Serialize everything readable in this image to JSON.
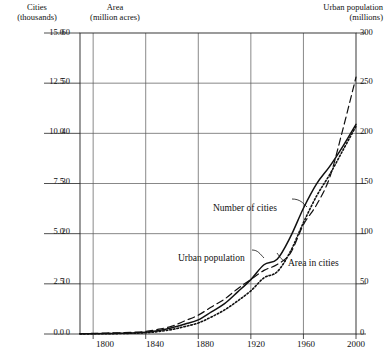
{
  "chart_data": {
    "type": "line",
    "title": "",
    "subtitle": "",
    "xlabel": "",
    "xlim": [
      1790,
      2000
    ],
    "xticks": [
      1800,
      1840,
      1880,
      1920,
      1960,
      2000
    ],
    "grid": true,
    "legend_position": "inline-annotations",
    "axes": [
      {
        "id": "left-outer",
        "name": "Cities",
        "unit_label": "(thousands)",
        "header_line1": "Cities",
        "header_line2": "(thousands)",
        "ticks": [
          "0.0",
          "2.5",
          "5.0",
          "7.5",
          "10.0",
          "12.5",
          "15.0"
        ],
        "ylim": [
          0,
          15
        ]
      },
      {
        "id": "left-inner",
        "name": "Area",
        "unit_label": "(million acres)",
        "header_line1": "Area",
        "header_line2": "(million acres)",
        "ticks": [
          "0",
          "10",
          "20",
          "30",
          "40",
          "50",
          "60"
        ],
        "ylim": [
          0,
          60
        ]
      },
      {
        "id": "right",
        "name": "Urban population",
        "unit_label": "(millions)",
        "header_line1": "Urban population",
        "header_line2": "(millions)",
        "ticks": [
          "0",
          "50",
          "100",
          "150",
          "200",
          "250",
          "300"
        ],
        "ylim": [
          0,
          300
        ]
      }
    ],
    "x": [
      1790,
      1800,
      1810,
      1820,
      1830,
      1840,
      1850,
      1860,
      1870,
      1880,
      1890,
      1900,
      1910,
      1920,
      1930,
      1940,
      1950,
      1960,
      1970,
      1980,
      1990,
      2000
    ],
    "series": [
      {
        "name": "Number of cities",
        "label": "Number of cities",
        "axis": "left-outer",
        "units": "thousands",
        "style": "dashed",
        "values": [
          0.02,
          0.03,
          0.05,
          0.06,
          0.09,
          0.13,
          0.24,
          0.39,
          0.66,
          0.94,
          1.35,
          1.74,
          2.26,
          2.72,
          3.17,
          3.46,
          4.02,
          5.45,
          6.44,
          7.8,
          10.2,
          12.8
        ]
      },
      {
        "name": "Urban population",
        "label": "Urban population",
        "axis": "right",
        "units": "millions",
        "style": "solid",
        "values": [
          0.2,
          0.3,
          0.5,
          0.7,
          1.1,
          1.8,
          3.5,
          6.2,
          9.9,
          14.1,
          22.1,
          30.2,
          42.0,
          54.2,
          69.0,
          74.4,
          96.5,
          125.3,
          149.6,
          167.1,
          187.1,
          209.0
        ]
      },
      {
        "name": "Area in cities",
        "label": "Area in cities",
        "axis": "left-inner",
        "units": "million acres",
        "style": "dotted",
        "values": [
          0.02,
          0.04,
          0.06,
          0.09,
          0.15,
          0.25,
          0.5,
          0.9,
          1.5,
          2.2,
          3.4,
          4.8,
          6.6,
          8.6,
          11.2,
          12.4,
          16.4,
          22.2,
          27.5,
          31.8,
          36.6,
          41.4
        ]
      }
    ],
    "annotations": [
      {
        "text": "Number of cities",
        "for": "Number of cities"
      },
      {
        "text": "Urban population",
        "for": "Urban population"
      },
      {
        "text": "Area in cities",
        "for": "Area in cities"
      }
    ]
  },
  "headers": {
    "cities_l1": "Cities",
    "cities_l2": "(thousands)",
    "area_l1": "Area",
    "area_l2": "(million acres)",
    "urban_l1": "Urban population",
    "urban_l2": "(millions)"
  },
  "ticks": {
    "left_outer": [
      "15.0",
      "12.5",
      "10.0",
      "7.5",
      "5.0",
      "2.5",
      "0.0"
    ],
    "left_inner": [
      "60",
      "50",
      "40",
      "30",
      "20",
      "10",
      "0"
    ],
    "right": [
      "300",
      "250",
      "200",
      "150",
      "100",
      "50",
      "0"
    ],
    "x": [
      "1800",
      "1840",
      "1880",
      "1920",
      "1960",
      "2000"
    ]
  },
  "annotations": {
    "number_of_cities": "Number of cities",
    "urban_population": "Urban population",
    "area_in_cities": "Area in cities"
  },
  "colors": {
    "ink": "#1a1a1a",
    "grid": "#555555",
    "background": "#ffffff"
  }
}
